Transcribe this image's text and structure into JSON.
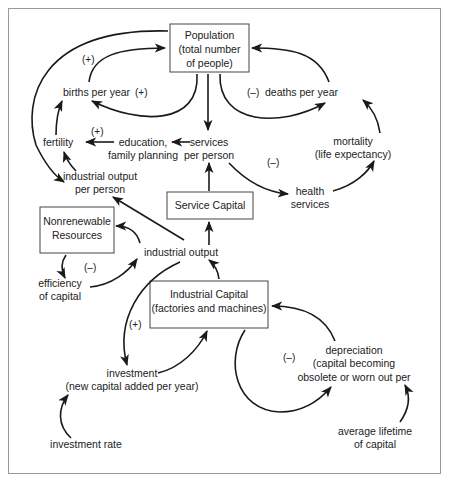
{
  "diagram": {
    "boxes": {
      "population": {
        "line1": "Population",
        "line2": "(total number",
        "line3": "of people)"
      },
      "service_capital": {
        "label": "Service Capital"
      },
      "nonrenewable": {
        "line1": "Nonrenewable",
        "line2": "Resources"
      },
      "industrial_capital": {
        "line1": "Industrial Capital",
        "line2": "(factories and machines)"
      }
    },
    "nodes": {
      "births": "births per year",
      "deaths": "deaths per year",
      "fertility": "fertility",
      "education_1": "education,",
      "education_2": "family planning",
      "services_1": "services",
      "services_2": "per person",
      "mortality_1": "mortality",
      "mortality_2": "(life expectancy)",
      "health_1": "health",
      "health_2": "services",
      "ind_out_pp_1": "industrial output",
      "ind_out_pp_2": "per person",
      "industrial_output": "industrial output",
      "efficiency_1": "efficiency",
      "efficiency_2": "of capital",
      "investment_1": "investment",
      "investment_2": "(new capital added per year)",
      "investment_rate": "investment rate",
      "depreciation_1": "depreciation",
      "depreciation_2": "(capital becoming",
      "depreciation_3": "obsolete or worn out per",
      "lifetime_1": "average lifetime",
      "lifetime_2": "of capital"
    },
    "signs": {
      "births_loop_top": "(+)",
      "births_loop_inner": "(+)",
      "deaths_loop": "(–)",
      "education_fertility": "(+)",
      "health_loop": "(–)",
      "efficiency_loop": "(–)",
      "investment_loop": "(+)",
      "depreciation_loop": "(–)"
    }
  }
}
